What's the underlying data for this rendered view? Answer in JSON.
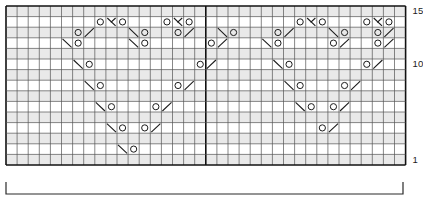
{
  "chart": {
    "kind": "knitting-stitch-chart",
    "grid": {
      "columns": 36,
      "rows": 15,
      "cell_width": 11.1,
      "cell_height": 10.6,
      "origin_x": 6,
      "origin_y": 6,
      "grid_line_color": "#555555",
      "bold_line_color": "#111111",
      "row_shading_color": "#e9e9e9",
      "background": "#ffffff",
      "bold_column_lines": [
        0,
        18,
        36
      ],
      "bold_row_lines": [
        0,
        15
      ],
      "shaded_rows": [
        15,
        13,
        11,
        9,
        7,
        5,
        3,
        1
      ]
    },
    "row_labels": [
      {
        "text": "15",
        "row": 15
      },
      {
        "text": "10",
        "row": 10
      },
      {
        "text": "1",
        "row": 1
      }
    ],
    "symbols": {
      "yarn_over": {
        "name": "yarn-over",
        "glyph": "O",
        "description": "yarn over"
      },
      "ssk": {
        "name": "left-leaning-decrease",
        "glyph": "\\",
        "description": "slip slip knit, left-leaning decrease"
      },
      "k2tog": {
        "name": "right-leaning-decrease",
        "glyph": "/",
        "description": "knit two together, right-leaning decrease"
      },
      "cdd": {
        "name": "central-double-decrease",
        "glyph": "λ",
        "description": "central double decrease"
      },
      "knit": {
        "name": "knit-stitch",
        "glyph": "",
        "description": "knit on right side, blank cell"
      }
    },
    "cells": [
      {
        "row": 14,
        "col": 9,
        "type": "yarn_over"
      },
      {
        "row": 14,
        "col": 10,
        "type": "cdd"
      },
      {
        "row": 14,
        "col": 11,
        "type": "yarn_over"
      },
      {
        "row": 14,
        "col": 15,
        "type": "yarn_over"
      },
      {
        "row": 14,
        "col": 16,
        "type": "cdd"
      },
      {
        "row": 14,
        "col": 17,
        "type": "yarn_over"
      },
      {
        "row": 14,
        "col": 27,
        "type": "yarn_over"
      },
      {
        "row": 14,
        "col": 28,
        "type": "cdd"
      },
      {
        "row": 14,
        "col": 29,
        "type": "yarn_over"
      },
      {
        "row": 14,
        "col": 33,
        "type": "yarn_over"
      },
      {
        "row": 14,
        "col": 34,
        "type": "cdd"
      },
      {
        "row": 14,
        "col": 35,
        "type": "yarn_over"
      },
      {
        "row": 13,
        "col": 7,
        "type": "yarn_over"
      },
      {
        "row": 13,
        "col": 8,
        "type": "k2tog"
      },
      {
        "row": 13,
        "col": 12,
        "type": "ssk"
      },
      {
        "row": 13,
        "col": 13,
        "type": "yarn_over"
      },
      {
        "row": 13,
        "col": 16,
        "type": "yarn_over"
      },
      {
        "row": 13,
        "col": 17,
        "type": "k2tog"
      },
      {
        "row": 13,
        "col": 20,
        "type": "ssk"
      },
      {
        "row": 13,
        "col": 21,
        "type": "yarn_over"
      },
      {
        "row": 13,
        "col": 25,
        "type": "yarn_over"
      },
      {
        "row": 13,
        "col": 26,
        "type": "k2tog"
      },
      {
        "row": 13,
        "col": 30,
        "type": "ssk"
      },
      {
        "row": 13,
        "col": 31,
        "type": "yarn_over"
      },
      {
        "row": 13,
        "col": 34,
        "type": "yarn_over"
      },
      {
        "row": 13,
        "col": 35,
        "type": "k2tog"
      },
      {
        "row": 12,
        "col": 6,
        "type": "ssk"
      },
      {
        "row": 12,
        "col": 7,
        "type": "yarn_over"
      },
      {
        "row": 12,
        "col": 12,
        "type": "ssk"
      },
      {
        "row": 12,
        "col": 13,
        "type": "yarn_over"
      },
      {
        "row": 12,
        "col": 19,
        "type": "yarn_over"
      },
      {
        "row": 12,
        "col": 20,
        "type": "k2tog"
      },
      {
        "row": 12,
        "col": 24,
        "type": "ssk"
      },
      {
        "row": 12,
        "col": 25,
        "type": "yarn_over"
      },
      {
        "row": 12,
        "col": 30,
        "type": "yarn_over"
      },
      {
        "row": 12,
        "col": 31,
        "type": "k2tog"
      },
      {
        "row": 12,
        "col": 34,
        "type": "yarn_over"
      },
      {
        "row": 12,
        "col": 35,
        "type": "k2tog"
      },
      {
        "row": 10,
        "col": 7,
        "type": "ssk"
      },
      {
        "row": 10,
        "col": 8,
        "type": "yarn_over"
      },
      {
        "row": 10,
        "col": 18,
        "type": "yarn_over"
      },
      {
        "row": 10,
        "col": 19,
        "type": "k2tog"
      },
      {
        "row": 10,
        "col": 25,
        "type": "ssk"
      },
      {
        "row": 10,
        "col": 26,
        "type": "yarn_over"
      },
      {
        "row": 10,
        "col": 33,
        "type": "yarn_over"
      },
      {
        "row": 10,
        "col": 34,
        "type": "k2tog"
      },
      {
        "row": 8,
        "col": 8,
        "type": "ssk"
      },
      {
        "row": 8,
        "col": 9,
        "type": "yarn_over"
      },
      {
        "row": 8,
        "col": 16,
        "type": "yarn_over"
      },
      {
        "row": 8,
        "col": 17,
        "type": "k2tog"
      },
      {
        "row": 8,
        "col": 26,
        "type": "ssk"
      },
      {
        "row": 8,
        "col": 27,
        "type": "yarn_over"
      },
      {
        "row": 8,
        "col": 31,
        "type": "yarn_over"
      },
      {
        "row": 8,
        "col": 32,
        "type": "k2tog"
      },
      {
        "row": 6,
        "col": 9,
        "type": "ssk"
      },
      {
        "row": 6,
        "col": 10,
        "type": "yarn_over"
      },
      {
        "row": 6,
        "col": 14,
        "type": "yarn_over"
      },
      {
        "row": 6,
        "col": 15,
        "type": "k2tog"
      },
      {
        "row": 6,
        "col": 27,
        "type": "ssk"
      },
      {
        "row": 6,
        "col": 28,
        "type": "yarn_over"
      },
      {
        "row": 6,
        "col": 30,
        "type": "yarn_over"
      },
      {
        "row": 6,
        "col": 31,
        "type": "k2tog"
      },
      {
        "row": 4,
        "col": 10,
        "type": "ssk"
      },
      {
        "row": 4,
        "col": 11,
        "type": "yarn_over"
      },
      {
        "row": 4,
        "col": 13,
        "type": "yarn_over"
      },
      {
        "row": 4,
        "col": 14,
        "type": "k2tog"
      },
      {
        "row": 4,
        "col": 29,
        "type": "yarn_over"
      },
      {
        "row": 4,
        "col": 30,
        "type": "k2tog"
      },
      {
        "row": 2,
        "col": 11,
        "type": "ssk"
      },
      {
        "row": 2,
        "col": 12,
        "type": "yarn_over"
      }
    ]
  },
  "repeat_bracket": {
    "name": "pattern-repeat-bracket",
    "x_start": 6,
    "x_end": 403,
    "y": 182,
    "height": 12,
    "color": "#2a2a2a",
    "label": ""
  }
}
